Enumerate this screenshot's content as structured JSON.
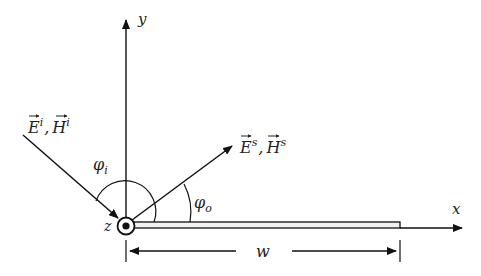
{
  "diagram": {
    "axes": {
      "x_label": "x",
      "y_label": "y",
      "z_label": "z"
    },
    "incident_label": "E⃗ⁱ, H⃗ⁱ",
    "incident_parts": {
      "e": "E",
      "e_sup": "i",
      "sep": ",",
      "h": "H",
      "h_sup": "i"
    },
    "scattered_parts": {
      "e": "E",
      "e_sup": "s",
      "sep": ",",
      "h": "H",
      "h_sup": "s"
    },
    "incident_angle_label": {
      "base": "φ",
      "sub": "i"
    },
    "scattered_angle_label": {
      "base": "φ",
      "sub": "o"
    },
    "width_label": "w",
    "colors": {
      "stroke": "#111111",
      "strip_fill": "#f2f2f2"
    }
  }
}
